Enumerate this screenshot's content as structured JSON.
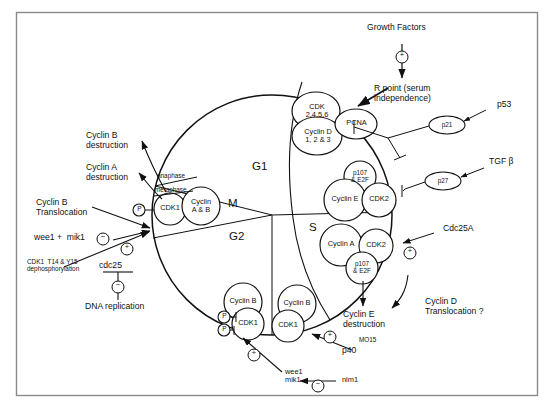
{
  "figure": {
    "frame_color": "#7a7a7a",
    "line_color": "#111111",
    "background": "#ffffff"
  },
  "cycle": {
    "phases": [
      {
        "name": "G1",
        "label": "G1"
      },
      {
        "name": "S",
        "label": "S"
      },
      {
        "name": "G2",
        "label": "G2"
      },
      {
        "name": "M",
        "label": "M"
      }
    ],
    "mitosis_markers": [
      {
        "name": "anaphase",
        "label": "anaphase"
      },
      {
        "name": "metaphase",
        "label": "metaphase"
      }
    ]
  },
  "complexes": [
    {
      "id": "cdk2456",
      "label": "CDK\n2,4,5,6"
    },
    {
      "id": "cyclind",
      "label": "Cyclin D\n1, 2 & 3"
    },
    {
      "id": "pcna",
      "label": "PCNA"
    },
    {
      "id": "p107e2f_g1",
      "label": "p107\n& E2F"
    },
    {
      "id": "cycline",
      "label": "Cyclin E"
    },
    {
      "id": "cdk2_g1s",
      "label": "CDK2"
    },
    {
      "id": "cyclina_s",
      "label": "Cyclin A"
    },
    {
      "id": "cdk2_s",
      "label": "CDK2"
    },
    {
      "id": "p107e2f_s",
      "label": "p107\n& E2F"
    },
    {
      "id": "cyclinb_g2",
      "label": "Cyclin B"
    },
    {
      "id": "cdk1_g2",
      "label": "CDK1"
    },
    {
      "id": "cyclinb_s",
      "label": "Cyclin B"
    },
    {
      "id": "cdk1_s",
      "label": "CDK1"
    },
    {
      "id": "cdk1_m",
      "label": "CDK1"
    },
    {
      "id": "cyclinab_m",
      "label": "Cyclin\nA & B"
    }
  ],
  "regulators": [
    {
      "id": "p21",
      "label": "p21"
    },
    {
      "id": "p27",
      "label": "p27"
    }
  ],
  "annotations": {
    "growth_factors": "Growth Factors",
    "r_point": "R point (serum\nindependence)",
    "p53": "p53",
    "tgfb": "TGF β",
    "cdc25a": "Cdc25A",
    "cyclin_d_translocation": "Cyclin D\nTranslocation ?",
    "cyclin_e_destruction": "Cyclin E\ndestruction",
    "mo15": "MO15",
    "p40": "p40",
    "wee1_mik1_bottom": "wee1\nmik1",
    "nim1": "nim1",
    "cyclin_b_destruction": "Cyclin B\ndestruction",
    "cyclin_a_destruction": "Cyclin A\ndestruction",
    "cyclin_b_translocation": "Cyclin B\nTranslocation",
    "wee1_mik1_left": "wee1 +  mik1",
    "cdk1_dephos": "CDK1  T14 & Y15\ndephosphorylation",
    "cdc25": "cdc25",
    "dna_replication": "DNA replication"
  },
  "symbols": {
    "plus": "+",
    "minus": "−",
    "phospho": "P"
  }
}
